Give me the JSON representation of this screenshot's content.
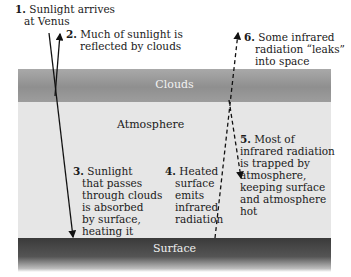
{
  "diagram": {
    "layers": {
      "clouds": "Clouds",
      "atmosphere": "Atmosphere",
      "surface": "Surface"
    },
    "steps": [
      {
        "num": "1.",
        "lines": [
          "Sunlight arrives",
          "at Venus"
        ]
      },
      {
        "num": "2.",
        "lines": [
          "Much of sunlight is",
          "reflected by clouds"
        ]
      },
      {
        "num": "3.",
        "lines": [
          "Sunlight",
          "that passes",
          "through clouds",
          "is absorbed",
          "by surface,",
          "heating it"
        ]
      },
      {
        "num": "4.",
        "lines": [
          "Heated",
          "surface",
          "emits",
          "infrared",
          "radiation"
        ]
      },
      {
        "num": "5.",
        "lines": [
          "Most of",
          "infrared radiation",
          "is trapped by",
          "atmosphere,",
          "keeping surface",
          "and atmosphere",
          "hot"
        ]
      },
      {
        "num": "6.",
        "lines": [
          "Some infrared",
          "radiation “leaks”",
          "into space"
        ]
      }
    ],
    "colors": {
      "clouds": "#9a9a9a",
      "atmosphere": "#e6e6e6",
      "surface": "#444444",
      "arrow": "#111111"
    }
  }
}
